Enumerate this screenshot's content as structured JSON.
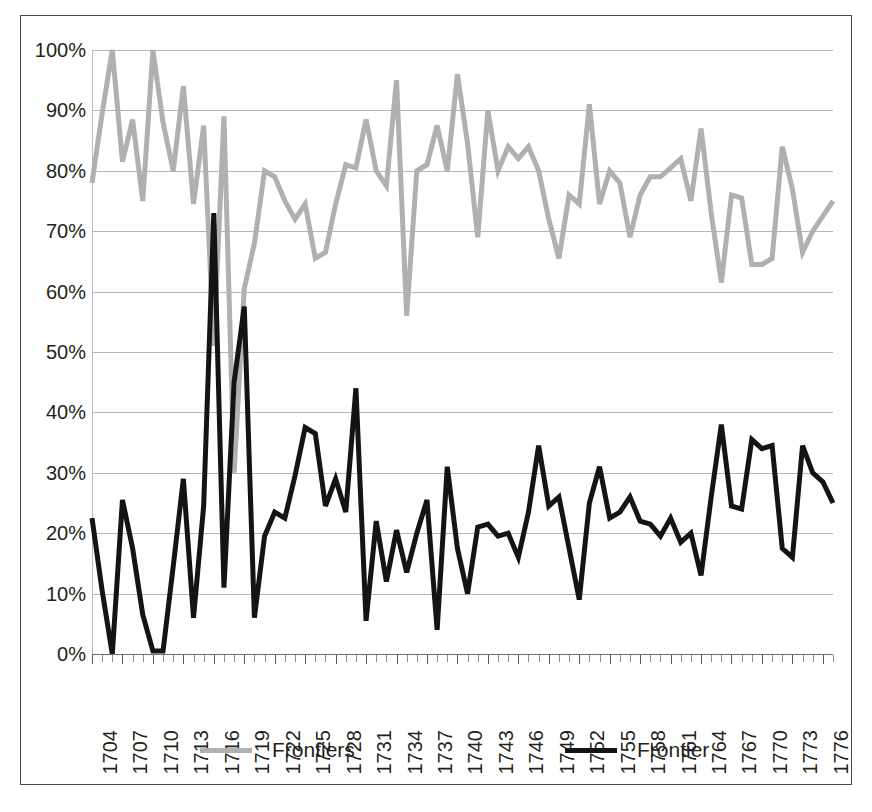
{
  "chart_data": {
    "type": "line",
    "title": "",
    "subtitle": "",
    "xlabel": "",
    "ylabel": "",
    "ylim": [
      0,
      1.0
    ],
    "ytick_labels": [
      "0%",
      "10%",
      "20%",
      "30%",
      "40%",
      "50%",
      "60%",
      "70%",
      "80%",
      "90%",
      "100%"
    ],
    "ytick_values": [
      0,
      0.1,
      0.2,
      0.3,
      0.4,
      0.5,
      0.6,
      0.7,
      0.8,
      0.9,
      1.0
    ],
    "grid": true,
    "legend_position": "bottom",
    "x_start": 1704,
    "x_end": 1777,
    "xtick_label_step": 3,
    "x": [
      1704,
      1705,
      1706,
      1707,
      1708,
      1709,
      1710,
      1711,
      1712,
      1713,
      1714,
      1715,
      1716,
      1717,
      1718,
      1719,
      1720,
      1721,
      1722,
      1723,
      1724,
      1725,
      1726,
      1727,
      1728,
      1729,
      1730,
      1731,
      1732,
      1733,
      1734,
      1735,
      1736,
      1737,
      1738,
      1739,
      1740,
      1741,
      1742,
      1743,
      1744,
      1745,
      1746,
      1747,
      1748,
      1749,
      1750,
      1751,
      1752,
      1753,
      1754,
      1755,
      1756,
      1757,
      1758,
      1759,
      1760,
      1761,
      1762,
      1763,
      1764,
      1765,
      1766,
      1767,
      1768,
      1769,
      1770,
      1771,
      1772,
      1773,
      1774,
      1775,
      1776,
      1777
    ],
    "xtick_labels": [
      "1704",
      "1707",
      "1710",
      "1713",
      "1716",
      "1719",
      "1722",
      "1725",
      "1728",
      "1731",
      "1734",
      "1737",
      "1740",
      "1743",
      "1746",
      "1749",
      "1752",
      "1755",
      "1758",
      "1761",
      "1764",
      "1767",
      "1770",
      "1773",
      "1776"
    ],
    "series": [
      {
        "name": "Frontiers",
        "color": "#b0b0b0",
        "values": [
          0.78,
          0.895,
          1.0,
          0.815,
          0.885,
          0.75,
          1.0,
          0.88,
          0.8,
          0.94,
          0.745,
          0.875,
          0.51,
          0.89,
          0.3,
          0.605,
          0.68,
          0.8,
          0.79,
          0.75,
          0.72,
          0.745,
          0.655,
          0.665,
          0.745,
          0.81,
          0.805,
          0.885,
          0.8,
          0.775,
          0.95,
          0.56,
          0.8,
          0.81,
          0.875,
          0.8,
          0.96,
          0.845,
          0.69,
          0.9,
          0.8,
          0.84,
          0.82,
          0.84,
          0.8,
          0.72,
          0.655,
          0.76,
          0.745,
          0.91,
          0.745,
          0.8,
          0.78,
          0.69,
          0.76,
          0.79,
          0.79,
          0.805,
          0.82,
          0.75,
          0.87,
          0.73,
          0.615,
          0.76,
          0.755,
          0.645,
          0.645,
          0.655,
          0.84,
          0.77,
          0.665,
          0.7,
          0.725,
          0.75
        ]
      },
      {
        "name": "Frontier",
        "color": "#141414",
        "values": [
          0.225,
          0.105,
          0.0,
          0.255,
          0.175,
          0.065,
          0.005,
          0.005,
          0.145,
          0.29,
          0.06,
          0.245,
          0.73,
          0.11,
          0.45,
          0.575,
          0.06,
          0.195,
          0.235,
          0.225,
          0.295,
          0.375,
          0.365,
          0.245,
          0.29,
          0.235,
          0.44,
          0.055,
          0.22,
          0.12,
          0.205,
          0.135,
          0.2,
          0.255,
          0.04,
          0.31,
          0.175,
          0.1,
          0.21,
          0.215,
          0.195,
          0.2,
          0.16,
          0.235,
          0.345,
          0.245,
          0.26,
          0.175,
          0.09,
          0.25,
          0.31,
          0.225,
          0.235,
          0.26,
          0.22,
          0.215,
          0.195,
          0.225,
          0.185,
          0.2,
          0.13,
          0.26,
          0.38,
          0.245,
          0.24,
          0.355,
          0.34,
          0.345,
          0.175,
          0.16,
          0.345,
          0.3,
          0.285,
          0.25
        ]
      }
    ]
  },
  "legend": {
    "entries": [
      {
        "label": "Frontiers",
        "color": "#b0b0b0"
      },
      {
        "label": "Frontier",
        "color": "#141414"
      }
    ]
  }
}
